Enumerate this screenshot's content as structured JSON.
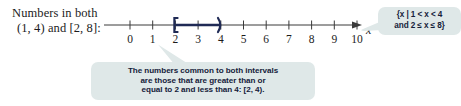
{
  "caption": {
    "line1": "Numbers in both",
    "line2": "(1, 4) and [2, 8]:"
  },
  "numberline": {
    "axis_variable": "x",
    "ticks": [
      "0",
      "1",
      "2",
      "3",
      "4",
      "5",
      "6",
      "7",
      "8",
      "9",
      "10"
    ],
    "tick_values": [
      0,
      1,
      2,
      3,
      4,
      5,
      6,
      7,
      8,
      9,
      10
    ],
    "axis_min": 0,
    "axis_max": 10,
    "right_arrow": true,
    "interval": {
      "from": 2,
      "to": 4,
      "left_endpoint_symbol": "[",
      "right_endpoint_symbol": ")",
      "left_closed": true,
      "right_closed": false,
      "color": "#1f2a55"
    }
  },
  "callout_set": {
    "line1": "{x | 1 < x < 4",
    "line2": "and 2 ≤ x ≤ 8}",
    "background": "#dfe8e8",
    "text_color": "#15213a"
  },
  "callout_note": {
    "line1": "The numbers common to both intervals",
    "line2": "are those that are greater than or",
    "line3": "equal to 2 and less than 4: [2, 4).",
    "background": "#dfe8e8",
    "text_color": "#15213a"
  },
  "colors": {
    "page_background": "#ffffff",
    "axis": "#3a3a3a",
    "text": "#1b1b1b",
    "highlight": "#1f2a55",
    "callout_background": "#dfe8e8"
  }
}
